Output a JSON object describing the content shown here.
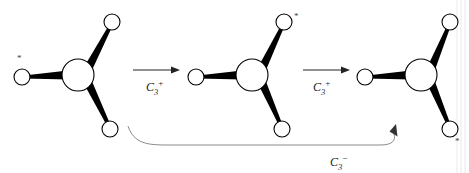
{
  "figure": {
    "background_color": "#ffffff",
    "line_color": "#000000",
    "curve_color": "#8a8a8a",
    "label_color": "#222222",
    "marker_color": "#444444",
    "marker_glyph": "*"
  },
  "molecules": [
    {
      "id": "molecule-1",
      "center": {
        "x": 78,
        "y": 75,
        "r": 16
      },
      "ligands": [
        {
          "name": "ligand-left",
          "x": 22,
          "y": 77,
          "r": 8,
          "starred": true,
          "star_x": 17,
          "star_y": 57
        },
        {
          "name": "ligand-upper-right",
          "x": 112,
          "y": 22,
          "r": 8,
          "starred": false,
          "star_x": 0,
          "star_y": 0
        },
        {
          "name": "ligand-lower-right",
          "x": 110,
          "y": 129,
          "r": 8,
          "starred": false,
          "star_x": 0,
          "star_y": 0
        }
      ]
    },
    {
      "id": "molecule-2",
      "center": {
        "x": 252,
        "y": 75,
        "r": 16
      },
      "ligands": [
        {
          "name": "ligand-left",
          "x": 196,
          "y": 77,
          "r": 8,
          "starred": false,
          "star_x": 0,
          "star_y": 0
        },
        {
          "name": "ligand-upper-right",
          "x": 284,
          "y": 22,
          "r": 8,
          "starred": true,
          "star_x": 296,
          "star_y": 18
        },
        {
          "name": "ligand-lower-right",
          "x": 282,
          "y": 129,
          "r": 8,
          "starred": false,
          "star_x": 0,
          "star_y": 0
        }
      ]
    },
    {
      "id": "molecule-3",
      "center": {
        "x": 421,
        "y": 75,
        "r": 16
      },
      "ligands": [
        {
          "name": "ligand-left",
          "x": 365,
          "y": 77,
          "r": 8,
          "starred": false,
          "star_x": 0,
          "star_y": 0
        },
        {
          "name": "ligand-upper-right",
          "x": 450,
          "y": 22,
          "r": 8,
          "starred": false,
          "star_x": 0,
          "star_y": 0
        },
        {
          "name": "ligand-lower-right",
          "x": 450,
          "y": 129,
          "r": 8,
          "starred": true,
          "star_x": 457,
          "star_y": 141
        }
      ]
    }
  ],
  "operations": [
    {
      "id": "arrow-1",
      "type": "straight",
      "symbol": "C",
      "subscript": "3",
      "superscript": "+",
      "label_text": "C3+",
      "from_molecule": "molecule-1",
      "to_molecule": "molecule-2",
      "shaft": {
        "x1": 133,
        "y1": 70,
        "x2": 174,
        "y2": 70
      },
      "label_pos": {
        "x": 146,
        "y": 91
      }
    },
    {
      "id": "arrow-2",
      "type": "straight",
      "symbol": "C",
      "subscript": "3",
      "superscript": "+",
      "label_text": "C3+",
      "from_molecule": "molecule-2",
      "to_molecule": "molecule-3",
      "shaft": {
        "x1": 303,
        "y1": 70,
        "x2": 344,
        "y2": 70
      },
      "label_pos": {
        "x": 313,
        "y": 91
      }
    },
    {
      "id": "arrow-3",
      "type": "curved",
      "symbol": "C",
      "subscript": "3",
      "superscript": "−",
      "label_text": "C3-",
      "from_molecule": "molecule-1",
      "to_molecule": "molecule-3",
      "path": "M 128,128 C 136,146 150,145 170,145 L 382,145 C 396,145 398,140 396,133",
      "label_pos": {
        "x": 332,
        "y": 166
      }
    }
  ],
  "edge_rules": [
    {
      "name": "page-edge-line-1",
      "x": 457
    },
    {
      "name": "page-edge-line-2",
      "x": 461
    },
    {
      "name": "page-edge-line-3",
      "x": 465
    }
  ]
}
